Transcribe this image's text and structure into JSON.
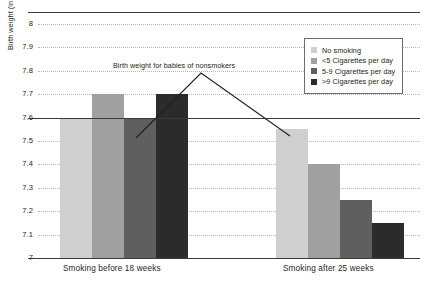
{
  "chart_data": {
    "type": "bar",
    "title": "",
    "subtitle": "",
    "xlabel": "",
    "ylabel": "Birth weight (in pounds; 7.5 pounds = 7 pounds 8 ounces)",
    "categories": [
      "Smoking before 18 weeks",
      "Smoking after 25 weeks"
    ],
    "ylim": [
      7,
      8
    ],
    "ytick_values": [
      7,
      7.1,
      7.2,
      7.3,
      7.4,
      7.5,
      7.6,
      7.7,
      7.8,
      7.9,
      8
    ],
    "ytick_labels": [
      "7",
      "7.1",
      "7.2",
      "7.3",
      "7.4",
      "7.5",
      "7.6",
      "7.7",
      "7.8",
      "7.9",
      "8"
    ],
    "grid": true,
    "legend_position": "top-right",
    "reference_line": {
      "value": 7.6,
      "label": "Birth weight for babies of nonsmokers"
    },
    "series": [
      {
        "name": "No smoking",
        "color": "#cfcfcf",
        "values": [
          7.6,
          7.55
        ]
      },
      {
        "name": "<5 Cigarettes per day",
        "color": "#a0a0a0",
        "values": [
          7.7,
          7.4
        ]
      },
      {
        "name": "5-9 Cigarettes per day",
        "color": "#5f5f5f",
        "values": [
          7.6,
          7.25
        ]
      },
      {
        "name": ">9 Cigarettes per day",
        "color": "#2b2b2b",
        "values": [
          7.7,
          7.15
        ]
      }
    ]
  },
  "legend": {
    "items": [
      {
        "label": "No smoking",
        "color": "#cfcfcf"
      },
      {
        "label": "<5 Cigarettes per day",
        "color": "#a0a0a0"
      },
      {
        "label": "5-9 Cigarettes per day",
        "color": "#5f5f5f"
      },
      {
        "label": ">9 Cigarettes per day",
        "color": "#2b2b2b"
      }
    ]
  },
  "annotation": {
    "text": "Birth weight for babies of nonsmokers"
  },
  "axis": {
    "y_title": "Birth weight (in pounds; 7.5 pounds = 7 pounds 8 ounces)",
    "x_labels": [
      "Smoking before 18 weeks",
      "Smoking after 25 weeks"
    ]
  },
  "colors": {
    "text": "#231f20",
    "grid": "#b9b9b9",
    "axis": "#3b3b3b"
  }
}
